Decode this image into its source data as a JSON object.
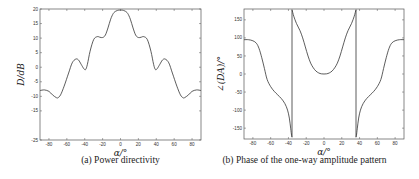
{
  "chart_data": [
    {
      "id": "a",
      "type": "line",
      "caption": "(a) Power directivity",
      "title": "",
      "xlabel": "α/°",
      "ylabel": "D/dB",
      "xlim": [
        -90,
        90
      ],
      "ylim": [
        -25,
        20
      ],
      "xticks": [
        -80,
        -60,
        -40,
        -20,
        0,
        20,
        40,
        60,
        80
      ],
      "yticks": [
        20,
        15,
        10,
        5,
        0,
        -5,
        -10,
        -15,
        -25
      ],
      "ytick_labels": [
        "20",
        "15",
        "10",
        "5",
        "0",
        "-5",
        "-10",
        "-15",
        "-25"
      ],
      "grid": false,
      "legend": null,
      "series": [
        {
          "name": "D",
          "x": [
            -90,
            -85,
            -80,
            -76,
            -72,
            -70,
            -67,
            -63,
            -58,
            -54,
            -50,
            -47,
            -44,
            -41,
            -39,
            -37,
            -34,
            -30,
            -26,
            -23,
            -20,
            -17,
            -14,
            -11,
            -8,
            -5,
            -2,
            0,
            2,
            5,
            8,
            11,
            14,
            17,
            20,
            23,
            26,
            30,
            34,
            37,
            39,
            41,
            44,
            47,
            50,
            54,
            58,
            63,
            67,
            70,
            72,
            76,
            80,
            85,
            90
          ],
          "y": [
            -8,
            -7.8,
            -8.3,
            -9.5,
            -10.4,
            -10.5,
            -9.5,
            -6.5,
            -2,
            1.5,
            2.8,
            2.5,
            1,
            -0.5,
            -0.8,
            1,
            5.5,
            9.5,
            10.5,
            10.3,
            10.2,
            11,
            13.5,
            16.5,
            18.5,
            19.3,
            19.6,
            19.6,
            19.6,
            19.3,
            18.5,
            16.5,
            13.5,
            11,
            10.2,
            10.3,
            10.5,
            9.5,
            5.5,
            1,
            -0.8,
            -0.5,
            1,
            2.5,
            2.8,
            1.5,
            -2,
            -6.5,
            -9.5,
            -10.5,
            -10.4,
            -9.5,
            -8.3,
            -7.8,
            -8
          ]
        }
      ]
    },
    {
      "id": "b",
      "type": "line",
      "caption": "(b) Phase of the one-way amplitude pattern",
      "title": "",
      "xlabel": "α/°",
      "ylabel": "∠(D_A)/°",
      "xlim": [
        -90,
        90
      ],
      "ylim": [
        -180,
        180
      ],
      "xticks": [
        -80,
        -60,
        -40,
        -20,
        0,
        20,
        40,
        60,
        80
      ],
      "yticks": [
        150,
        100,
        50,
        0,
        -50,
        -100,
        -150
      ],
      "ytick_labels": [
        "150",
        "100",
        "50",
        "0",
        "-50",
        "-100",
        "-150"
      ],
      "grid": false,
      "legend": null,
      "series": [
        {
          "name": "phase",
          "segments": [
            {
              "x": [
                -90,
                -85,
                -80,
                -76,
                -73,
                -70,
                -67,
                -64,
                -60,
                -56,
                -52,
                -48,
                -44,
                -41,
                -39,
                -37.5,
                -36.5,
                -36
              ],
              "y": [
                95,
                95,
                92,
                85,
                70,
                45,
                15,
                -15,
                -35,
                -48,
                -58,
                -68,
                -82,
                -100,
                -122,
                -150,
                -170,
                -175
              ]
            },
            {
              "x": [
                -36,
                -36
              ],
              "y": [
                -175,
                178
              ]
            },
            {
              "x": [
                -36,
                -34,
                -31,
                -27,
                -24,
                -21,
                -18,
                -15,
                -12,
                -9,
                -6,
                -3,
                0,
                3,
                6,
                9,
                12,
                15,
                18,
                21,
                24,
                27,
                31,
                34,
                36
              ],
              "y": [
                178,
                160,
                140,
                120,
                100,
                75,
                50,
                30,
                17,
                8,
                3,
                0.5,
                0,
                0.5,
                3,
                8,
                17,
                30,
                50,
                75,
                100,
                120,
                140,
                160,
                178
              ]
            },
            {
              "x": [
                36,
                36
              ],
              "y": [
                178,
                -175
              ]
            },
            {
              "x": [
                36,
                36.5,
                37.5,
                39,
                41,
                44,
                48,
                52,
                56,
                60,
                64,
                67,
                70,
                73,
                76,
                80,
                85,
                90
              ],
              "y": [
                -175,
                -170,
                -150,
                -122,
                -100,
                -82,
                -68,
                -58,
                -48,
                -35,
                -15,
                15,
                45,
                70,
                85,
                92,
                95,
                95
              ]
            }
          ]
        }
      ]
    }
  ]
}
